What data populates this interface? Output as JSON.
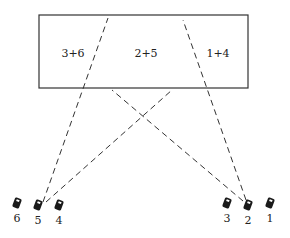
{
  "diagram": {
    "box": {
      "x": 39,
      "y": 15,
      "width": 209,
      "height": 73,
      "regions": [
        {
          "label": "3+6",
          "x": 73,
          "y": 57
        },
        {
          "label": "2+5",
          "x": 146,
          "y": 57
        },
        {
          "label": "1+4",
          "x": 218,
          "y": 57
        }
      ]
    },
    "cameras": [
      {
        "id": "6",
        "label": "6",
        "x": 17,
        "y": 203
      },
      {
        "id": "5",
        "label": "5",
        "x": 38,
        "y": 205
      },
      {
        "id": "4",
        "label": "4",
        "x": 59,
        "y": 205
      },
      {
        "id": "3",
        "label": "3",
        "x": 227,
        "y": 203
      },
      {
        "id": "2",
        "label": "2",
        "x": 248,
        "y": 205
      },
      {
        "id": "1",
        "label": "1",
        "x": 270,
        "y": 203
      }
    ],
    "sightlines": [
      {
        "from": "5",
        "x1": 43,
        "y1": 202,
        "x2": 108,
        "y2": 18
      },
      {
        "from": "5",
        "x1": 46,
        "y1": 202,
        "x2": 172,
        "y2": 90
      },
      {
        "from": "2",
        "x1": 246,
        "y1": 200,
        "x2": 183,
        "y2": 20
      },
      {
        "from": "2",
        "x1": 243,
        "y1": 201,
        "x2": 112,
        "y2": 90
      }
    ],
    "colors": {
      "stroke": "#333333",
      "camera": "#1a1a1a"
    }
  }
}
